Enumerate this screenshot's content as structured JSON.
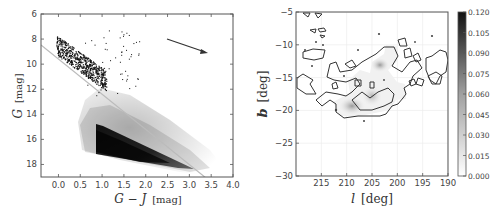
{
  "chart_data": [
    {
      "type": "scatter",
      "title": "",
      "xlabel": "G − J [mag]",
      "ylabel": "G [mag]",
      "xlim": [
        -0.4,
        4.0
      ],
      "ylim": [
        19,
        6
      ],
      "y_inverted": true,
      "xticks": [
        "0.0",
        "0.5",
        "1.0",
        "1.5",
        "2.0",
        "2.5",
        "3.0",
        "3.5",
        "4.0"
      ],
      "yticks": [
        "6",
        "8",
        "10",
        "12",
        "14",
        "16",
        "18"
      ],
      "grid": false,
      "description": "Color-magnitude diagram: dense gray 2D density of field stars bounded roughly by G-J>0.85 and a lower diagonal cut; black scatter points of candidate stars in upper-left (G-J 0 to 1.5, G 7.5 to 12.5); a gray diagonal selection line; reddening vector arrow.",
      "selection_line": {
        "x": [
          -0.4,
          3.4
        ],
        "y": [
          8.8,
          19.0
        ]
      },
      "density_region": {
        "polygon": [
          [
            0.85,
            12.3
          ],
          [
            1.0,
            12.5
          ],
          [
            3.3,
            18.0
          ],
          [
            2.9,
            17.9
          ],
          [
            0.85,
            15.9
          ]
        ],
        "faint_halo_extent": [
          [
            1.0,
            11.5
          ],
          [
            3.5,
            18.0
          ]
        ]
      },
      "reddening_arrow": {
        "from": [
          2.5,
          8.0
        ],
        "to": [
          3.45,
          9.1
        ]
      },
      "scatter_points_region": {
        "x_range": [
          -0.2,
          1.8
        ],
        "y_range": [
          7.3,
          12.5
        ],
        "approx_count": 700
      }
    },
    {
      "type": "heatmap",
      "title": "",
      "xlabel": "l [deg]",
      "ylabel": "b [deg]",
      "xlim": [
        220,
        190
      ],
      "ylim": [
        -30,
        -5
      ],
      "xticks": [
        "215",
        "210",
        "205",
        "200",
        "195",
        "190"
      ],
      "yticks": [
        "-5",
        "-10",
        "-15",
        "-20",
        "-25",
        "-30"
      ],
      "grid": true,
      "colorbar": {
        "ticks": [
          "0.000",
          "0.015",
          "0.030",
          "0.045",
          "0.060",
          "0.075",
          "0.090",
          "0.105",
          "0.120"
        ],
        "range": [
          0.0,
          0.12
        ],
        "colormap": "Greys"
      },
      "description": "Gray-scale density map with contour outline; main contoured cloud spanning l 213-200, b -10 to -20; density peaks near (l=206,b=-12.8) and (l=209,b=-19.5); smaller contour patches at l~218 (b -11 to -15), and l 190-197 (b -12 to -16).",
      "peaks": [
        {
          "l": 206.0,
          "b": -12.8,
          "value": 0.04
        },
        {
          "l": 209.0,
          "b": -19.5,
          "value": 0.045
        },
        {
          "l": 206.5,
          "b": -17.5,
          "value": 0.03
        }
      ]
    }
  ],
  "left_plot": {
    "xlabel_main": "G − J",
    "xlabel_unit": "[mag]",
    "ylabel_main": "G",
    "ylabel_unit": "[mag]",
    "xticks": [
      "0.0",
      "0.5",
      "1.0",
      "1.5",
      "2.0",
      "2.5",
      "3.0",
      "3.5",
      "4.0"
    ],
    "yticks": [
      "6",
      "8",
      "10",
      "12",
      "14",
      "16",
      "18"
    ]
  },
  "right_plot": {
    "xlabel_main": "l",
    "xlabel_unit": "[deg]",
    "ylabel_main": "b",
    "ylabel_unit": "[deg]",
    "xticks": [
      "215",
      "210",
      "205",
      "200",
      "195",
      "190"
    ],
    "yticks": [
      "−5",
      "−10",
      "−15",
      "−20",
      "−25",
      "−30"
    ],
    "colorbar_ticks": [
      "0.120",
      "0.105",
      "0.090",
      "0.075",
      "0.060",
      "0.045",
      "0.030",
      "0.015",
      "0.000"
    ]
  }
}
